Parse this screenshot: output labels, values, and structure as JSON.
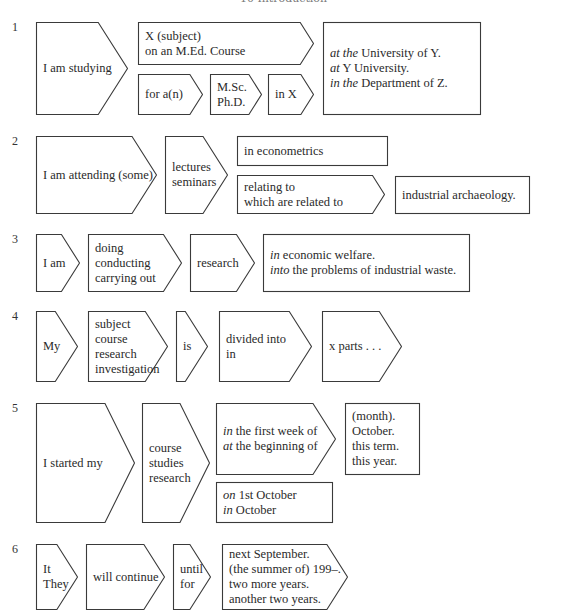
{
  "header": "10 Introduction",
  "rows": [
    {
      "number": "1",
      "shapes": [
        {
          "id": "r1-s1",
          "type": "arrow",
          "x": 36,
          "y": 22,
          "w": 92,
          "h": 93,
          "lines": [
            [
              [
                "",
                "I am studying"
              ]
            ]
          ]
        },
        {
          "id": "r1-s2",
          "type": "arrow",
          "x": 138,
          "y": 22,
          "w": 176,
          "h": 43,
          "lines": [
            [
              [
                "",
                "X (subject)"
              ]
            ],
            [
              [
                "",
                "on an M.Ed. Course"
              ]
            ]
          ]
        },
        {
          "id": "r1-s3",
          "type": "arrow",
          "x": 138,
          "y": 74,
          "w": 65,
          "h": 41,
          "lines": [
            [
              [
                "",
                "for a(n)"
              ]
            ]
          ]
        },
        {
          "id": "r1-s4",
          "type": "arrow",
          "x": 210,
          "y": 74,
          "w": 52,
          "h": 41,
          "lines": [
            [
              [
                "",
                "M.Sc."
              ]
            ],
            [
              [
                "",
                "Ph.D."
              ]
            ]
          ]
        },
        {
          "id": "r1-s5",
          "type": "arrow",
          "x": 268,
          "y": 74,
          "w": 46,
          "h": 41,
          "lines": [
            [
              [
                "",
                "in X"
              ]
            ]
          ]
        },
        {
          "id": "r1-s6",
          "type": "rect",
          "x": 323,
          "y": 22,
          "w": 158,
          "h": 93,
          "lines": [
            [
              [
                "at the",
                " University of Y."
              ]
            ],
            [
              [
                "at",
                " Y University."
              ]
            ],
            [
              [
                "in the",
                " Department of Z."
              ]
            ]
          ]
        }
      ]
    },
    {
      "number": "2",
      "shapes": [
        {
          "id": "r2-s1",
          "type": "arrow",
          "x": 36,
          "y": 136,
          "w": 121,
          "h": 78,
          "lines": [
            [
              [
                "",
                "I am attending (some)"
              ]
            ]
          ]
        },
        {
          "id": "r2-s2",
          "type": "arrow",
          "x": 165,
          "y": 136,
          "w": 63,
          "h": 78,
          "lines": [
            [
              [
                "",
                "lectures"
              ]
            ],
            [
              [
                "",
                "seminars"
              ]
            ]
          ]
        },
        {
          "id": "r2-s3",
          "type": "rect",
          "x": 237,
          "y": 136,
          "w": 151,
          "h": 30,
          "lines": [
            [
              [
                "",
                "in econometrics"
              ]
            ]
          ]
        },
        {
          "id": "r2-s4",
          "type": "arrow",
          "x": 237,
          "y": 175,
          "w": 148,
          "h": 39,
          "lines": [
            [
              [
                "",
                "relating to"
              ]
            ],
            [
              [
                "",
                "which are related to"
              ]
            ]
          ]
        },
        {
          "id": "r2-s5",
          "type": "rect",
          "x": 395,
          "y": 176,
          "w": 135,
          "h": 38,
          "lines": [
            [
              [
                "",
                "industrial archaeology."
              ]
            ]
          ]
        }
      ]
    },
    {
      "number": "3",
      "shapes": [
        {
          "id": "r3-s1",
          "type": "arrow",
          "x": 36,
          "y": 234,
          "w": 44,
          "h": 58,
          "lines": [
            [
              [
                "",
                "I am"
              ]
            ]
          ]
        },
        {
          "id": "r3-s2",
          "type": "arrow",
          "x": 88,
          "y": 234,
          "w": 94,
          "h": 58,
          "lines": [
            [
              [
                "",
                "doing"
              ]
            ],
            [
              [
                "",
                "conducting"
              ]
            ],
            [
              [
                "",
                "carrying out"
              ]
            ]
          ]
        },
        {
          "id": "r3-s3",
          "type": "arrow",
          "x": 190,
          "y": 234,
          "w": 65,
          "h": 58,
          "lines": [
            [
              [
                "",
                "research"
              ]
            ]
          ]
        },
        {
          "id": "r3-s4",
          "type": "rect",
          "x": 263,
          "y": 234,
          "w": 207,
          "h": 58,
          "lines": [
            [
              [
                "in",
                " economic welfare."
              ]
            ],
            [
              [
                "into",
                " the problems of industrial waste."
              ]
            ]
          ]
        }
      ]
    },
    {
      "number": "4",
      "shapes": [
        {
          "id": "r4-s1",
          "type": "arrow",
          "x": 36,
          "y": 311,
          "w": 42,
          "h": 71,
          "lines": [
            [
              [
                "",
                "My"
              ]
            ]
          ]
        },
        {
          "id": "r4-s2",
          "type": "arrow",
          "x": 88,
          "y": 311,
          "w": 80,
          "h": 71,
          "lines": [
            [
              [
                "",
                "subject"
              ]
            ],
            [
              [
                "",
                "course"
              ]
            ],
            [
              [
                "",
                "research"
              ]
            ],
            [
              [
                "",
                "investigation"
              ]
            ]
          ]
        },
        {
          "id": "r4-s3",
          "type": "arrow",
          "x": 176,
          "y": 311,
          "w": 32,
          "h": 71,
          "lines": [
            [
              [
                "",
                "is"
              ]
            ]
          ]
        },
        {
          "id": "r4-s4",
          "type": "arrow",
          "x": 219,
          "y": 311,
          "w": 93,
          "h": 71,
          "lines": [
            [
              [
                "",
                "divided into"
              ]
            ],
            [
              [
                "",
                "in"
              ]
            ]
          ]
        },
        {
          "id": "r4-s5",
          "type": "arrow",
          "x": 322,
          "y": 311,
          "w": 80,
          "h": 71,
          "lines": [
            [
              [
                "",
                "x parts . . ."
              ]
            ]
          ]
        }
      ]
    },
    {
      "number": "5",
      "shapes": [
        {
          "id": "r5-s1",
          "type": "arrow",
          "x": 36,
          "y": 403,
          "w": 99,
          "h": 120,
          "lines": [
            [
              [
                "",
                "I started my"
              ]
            ]
          ]
        },
        {
          "id": "r5-s2",
          "type": "arrow",
          "x": 142,
          "y": 403,
          "w": 68,
          "h": 120,
          "lines": [
            [
              [
                "",
                "course"
              ]
            ],
            [
              [
                "",
                "studies"
              ]
            ],
            [
              [
                "",
                "research"
              ]
            ]
          ]
        },
        {
          "id": "r5-s3",
          "type": "arrow",
          "x": 216,
          "y": 403,
          "w": 120,
          "h": 72,
          "lines": [
            [
              [
                "in",
                " the first week of"
              ]
            ],
            [
              [
                "at",
                " the beginning of"
              ]
            ]
          ]
        },
        {
          "id": "r5-s4",
          "type": "rect",
          "x": 345,
          "y": 403,
          "w": 75,
          "h": 72,
          "lines": [
            [
              [
                "",
                "(month)."
              ]
            ],
            [
              [
                "",
                "October."
              ]
            ],
            [
              [
                "",
                "this term."
              ]
            ],
            [
              [
                "",
                "this year."
              ]
            ]
          ]
        },
        {
          "id": "r5-s5",
          "type": "rect",
          "x": 216,
          "y": 482,
          "w": 117,
          "h": 41,
          "lines": [
            [
              [
                "on",
                " 1st October"
              ]
            ],
            [
              [
                "in",
                " October"
              ]
            ]
          ]
        }
      ]
    },
    {
      "number": "6",
      "shapes": [
        {
          "id": "r6-s1",
          "type": "arrow",
          "x": 36,
          "y": 544,
          "w": 42,
          "h": 66,
          "lines": [
            [
              [
                "",
                "It"
              ]
            ],
            [
              [
                "",
                "They"
              ]
            ]
          ]
        },
        {
          "id": "r6-s2",
          "type": "arrow",
          "x": 86,
          "y": 544,
          "w": 79,
          "h": 66,
          "lines": [
            [
              [
                "",
                "will continue"
              ]
            ]
          ]
        },
        {
          "id": "r6-s3",
          "type": "arrow",
          "x": 173,
          "y": 544,
          "w": 38,
          "h": 66,
          "lines": [
            [
              [
                "",
                "until"
              ]
            ],
            [
              [
                "",
                "for"
              ]
            ]
          ]
        },
        {
          "id": "r6-s4",
          "type": "arrow",
          "x": 222,
          "y": 544,
          "w": 126,
          "h": 66,
          "lines": [
            [
              [
                "",
                "next September."
              ]
            ],
            [
              [
                "",
                "(the summer of) 199–."
              ]
            ],
            [
              [
                "",
                "two more years."
              ]
            ],
            [
              [
                "",
                "another two years."
              ]
            ]
          ]
        }
      ]
    }
  ],
  "number_positions": [
    {
      "x": 12,
      "y": 20
    },
    {
      "x": 12,
      "y": 134
    },
    {
      "x": 12,
      "y": 232
    },
    {
      "x": 12,
      "y": 309
    },
    {
      "x": 12,
      "y": 401
    },
    {
      "x": 12,
      "y": 542
    }
  ],
  "style": {
    "stroke": "#3a3a3a",
    "fill": "#ffffff"
  }
}
